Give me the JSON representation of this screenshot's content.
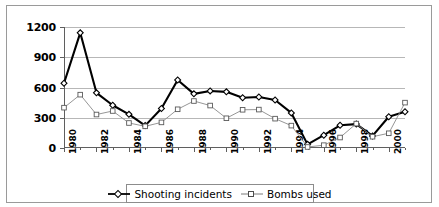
{
  "chart_data": {
    "type": "line",
    "title": "",
    "xlabel": "",
    "ylabel": "",
    "ylim": [
      0,
      1200
    ],
    "ytick_values": [
      0,
      300,
      600,
      900,
      1200
    ],
    "ytick_labels": [
      "0",
      "300",
      "600",
      "900",
      "1200"
    ],
    "grid": "horizontal",
    "legend_position": "bottom",
    "x": [
      1980,
      1981,
      1982,
      1983,
      1984,
      1985,
      1986,
      1987,
      1988,
      1989,
      1990,
      1991,
      1992,
      1993,
      1994,
      1995,
      1996,
      1997,
      1998,
      1999,
      2000,
      2001
    ],
    "xtick_labels": [
      "1980",
      "1982",
      "1984",
      "1986",
      "1988",
      "1990",
      "1992",
      "1994",
      "1996",
      "1998",
      "2000"
    ],
    "xtick_values": [
      1980,
      1982,
      1984,
      1986,
      1988,
      1990,
      1992,
      1994,
      1996,
      1998,
      2000
    ],
    "series": [
      {
        "name": "Shooting incidents",
        "marker": "diamond",
        "line_weight": "thick",
        "color": "#000000",
        "values": [
          642,
          1142,
          547,
          424,
          334,
          222,
          392,
          674,
          537,
          566,
          557,
          499,
          506,
          476,
          348,
          36,
          127,
          225,
          237,
          120,
          310,
          360
        ]
      },
      {
        "name": "Bombs used",
        "marker": "square",
        "line_weight": "thin",
        "color": "#777777",
        "values": [
          400,
          529,
          332,
          367,
          248,
          215,
          254,
          384,
          466,
          421,
          295,
          379,
          381,
          291,
          222,
          10,
          28,
          104,
          242,
          112,
          146,
          450
        ]
      }
    ]
  },
  "legend": {
    "items": [
      {
        "label": "Shooting incidents",
        "marker": "diamond-marker-icon"
      },
      {
        "label": "Bombs used",
        "marker": "square-marker-icon"
      }
    ]
  }
}
